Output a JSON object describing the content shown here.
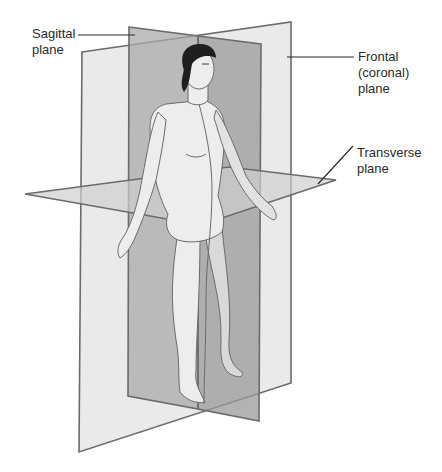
{
  "diagram": {
    "labels": {
      "sagittal": "Sagittal\nplane",
      "frontal": "Frontal\n(coronal)\nplane",
      "transverse": "Transverse\nplane"
    },
    "colors": {
      "frontal_fill": "#e6e6e6",
      "sagittal_fill": "#9a9a9a",
      "transverse_fill": "#cfcfcf",
      "edge": "#6b6b6b",
      "skin": "#ededed",
      "hair": "#1e1e1e",
      "text": "#2a2a2a"
    }
  }
}
